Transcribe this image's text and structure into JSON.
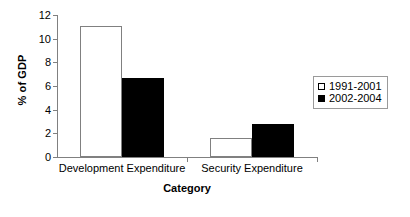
{
  "chart_data": {
    "type": "bar",
    "title": "",
    "subtitle": "",
    "xlabel": "Category",
    "ylabel": "% of GDP",
    "categories": [
      "Development Expenditure",
      "Security Expenditure"
    ],
    "series": [
      {
        "name": "1991-2001",
        "values": [
          11.1,
          1.6
        ],
        "color": "#ffffff",
        "edge_color": "#808080"
      },
      {
        "name": "2002-2004",
        "values": [
          6.7,
          2.8
        ],
        "color": "#000000",
        "edge_color": "#000000"
      }
    ],
    "ylim": [
      0,
      12
    ],
    "ytick_labels": [
      "0",
      "2",
      "4",
      "6",
      "8",
      "10",
      "12"
    ],
    "ytick_values": [
      0,
      2,
      4,
      6,
      8,
      10,
      12
    ],
    "grid": false,
    "legend_position": "right"
  },
  "legend": {
    "entries": [
      {
        "label": "1991-2001",
        "swatch": "hollow-square-icon"
      },
      {
        "label": "2002-2004",
        "swatch": "filled-square-icon"
      }
    ]
  },
  "axes": {
    "y_title": "% of GDP",
    "x_title": "Category"
  }
}
